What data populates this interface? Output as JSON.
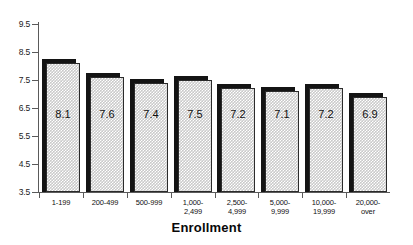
{
  "chart_data": {
    "type": "bar",
    "title": "",
    "xlabel": "Enrollment",
    "ylabel": "",
    "categories": [
      "1-199",
      "200-499",
      "500-999",
      "1,000-\n2,499",
      "2,500-\n4,999",
      "5,000-\n9,999",
      "10,000-\n19,999",
      "20,000-\nover"
    ],
    "values": [
      8.1,
      7.6,
      7.4,
      7.5,
      7.2,
      7.1,
      7.2,
      6.9
    ],
    "data_labels": [
      "8.1",
      "7.6",
      "7.4",
      "7.5",
      "7.2",
      "7.1",
      "7.2",
      "6.9"
    ],
    "ylim": [
      3.5,
      9.5
    ],
    "yticks": [
      9.5,
      8.5,
      7.5,
      6.5,
      5.5,
      4.5,
      3.5
    ],
    "ytick_labels": [
      "9.5",
      "8.5",
      "7.5",
      "6.5",
      "5.5",
      "4.5",
      "3.5"
    ],
    "grid": false,
    "legend": null,
    "legend_position": "none",
    "bar_fill_color": "#c9c9c9",
    "bar_edge_color": "#2b2b2b",
    "bar_shadow_color": "#141414",
    "axis_color": "#5a5a5a",
    "text_color": "#111111",
    "background_color": "#ffffff"
  }
}
